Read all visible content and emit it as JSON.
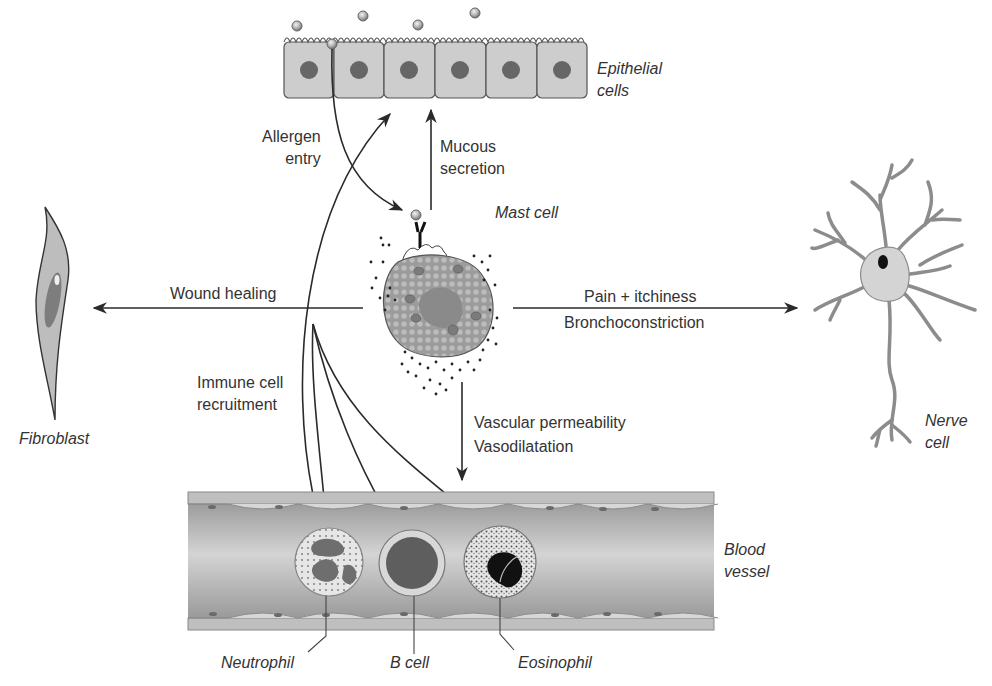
{
  "cells": {
    "epithelial": "Epithelial",
    "epithelial_2": "cells",
    "mast": "Mast cell",
    "fibroblast": "Fibroblast",
    "nerve": "Nerve",
    "nerve_2": "cell",
    "blood_vessel": "Blood",
    "blood_vessel_2": "vessel",
    "neutrophil": "Neutrophil",
    "b_cell": "B cell",
    "eosinophil": "Eosinophil"
  },
  "processes": {
    "allergen_entry": "Allergen",
    "allergen_entry_2": "entry",
    "mucous_secretion": "Mucous",
    "mucous_secretion_2": "secretion",
    "wound_healing": "Wound healing",
    "pain_itchiness": "Pain + itchiness",
    "bronchoconstriction": "Bronchoconstriction",
    "immune_recruitment": "Immune cell",
    "immune_recruitment_2": "recruitment",
    "vascular_permeability": "Vascular permeability",
    "vasodilatation": "Vasodilatation"
  },
  "colors": {
    "cell_fill": "#c8c8c8",
    "nucleus": "#6a6a6a",
    "line": "#2a2a2a",
    "vessel": "#a9a9a9"
  }
}
